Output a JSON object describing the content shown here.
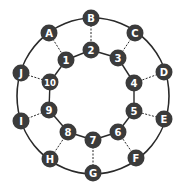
{
  "diagram": {
    "type": "ring-graph",
    "colors": {
      "node_fill": "#3b3b3b",
      "node_text": "#ffffff",
      "edge": "#2a2a2a",
      "background": "#ffffff"
    },
    "outer_ring": {
      "cx": 93,
      "cy": 96,
      "rx": 76,
      "ry": 78
    },
    "outer_nodes": [
      {
        "id": "A",
        "label": "A",
        "x": 49,
        "y": 33
      },
      {
        "id": "B",
        "label": "B",
        "x": 91,
        "y": 18
      },
      {
        "id": "C",
        "label": "C",
        "x": 135,
        "y": 33
      },
      {
        "id": "D",
        "label": "D",
        "x": 164,
        "y": 72
      },
      {
        "id": "E",
        "label": "E",
        "x": 164,
        "y": 119
      },
      {
        "id": "F",
        "label": "F",
        "x": 136,
        "y": 158
      },
      {
        "id": "G",
        "label": "G",
        "x": 93,
        "y": 173
      },
      {
        "id": "H",
        "label": "H",
        "x": 50,
        "y": 159
      },
      {
        "id": "I",
        "label": "I",
        "x": 21,
        "y": 121
      },
      {
        "id": "J",
        "label": "J",
        "x": 21,
        "y": 73
      }
    ],
    "inner_nodes": [
      {
        "id": "1",
        "label": "1",
        "x": 66,
        "y": 60
      },
      {
        "id": "2",
        "label": "2",
        "x": 91,
        "y": 50
      },
      {
        "id": "3",
        "label": "3",
        "x": 118,
        "y": 58
      },
      {
        "id": "4",
        "label": "4",
        "x": 134,
        "y": 83
      },
      {
        "id": "5",
        "label": "5",
        "x": 134,
        "y": 111
      },
      {
        "id": "6",
        "label": "6",
        "x": 118,
        "y": 132
      },
      {
        "id": "7",
        "label": "7",
        "x": 93,
        "y": 140
      },
      {
        "id": "8",
        "label": "8",
        "x": 68,
        "y": 132
      },
      {
        "id": "9",
        "label": "9",
        "x": 49,
        "y": 110
      },
      {
        "id": "10",
        "label": "10",
        "x": 50,
        "y": 82
      }
    ],
    "inner_edges": [
      [
        "1",
        "2"
      ],
      [
        "2",
        "3"
      ],
      [
        "3",
        "4"
      ],
      [
        "4",
        "5"
      ],
      [
        "5",
        "6"
      ],
      [
        "6",
        "7"
      ],
      [
        "7",
        "8"
      ],
      [
        "8",
        "9"
      ],
      [
        "9",
        "10"
      ],
      [
        "10",
        "1"
      ]
    ],
    "spoke_edges": [
      [
        "A",
        "1"
      ],
      [
        "B",
        "2"
      ],
      [
        "C",
        "3"
      ],
      [
        "D",
        "4"
      ],
      [
        "E",
        "5"
      ],
      [
        "F",
        "6"
      ],
      [
        "G",
        "7"
      ],
      [
        "H",
        "8"
      ],
      [
        "I",
        "9"
      ],
      [
        "J",
        "10"
      ]
    ]
  }
}
